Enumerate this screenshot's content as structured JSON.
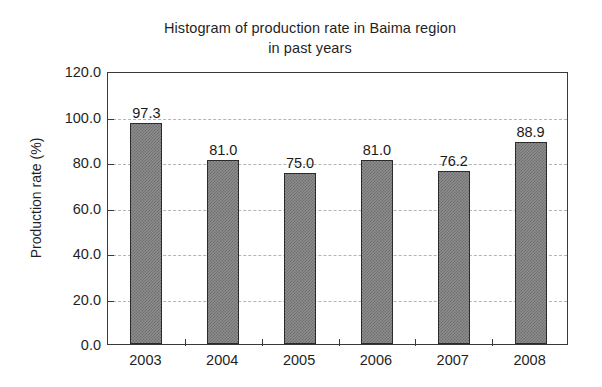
{
  "chart_data": {
    "type": "bar",
    "title": "Histogram of production rate in Baima region in past years",
    "title_lines": [
      "Histogram of production rate in Baima region",
      "in past years"
    ],
    "xlabel": "",
    "ylabel": "Production rate (%)",
    "categories": [
      "2003",
      "2004",
      "2005",
      "2006",
      "2007",
      "2008"
    ],
    "values": [
      97.3,
      81.0,
      75.0,
      81.0,
      76.2,
      88.9
    ],
    "value_labels": [
      "97.3",
      "81.0",
      "75.0",
      "81.0",
      "76.2",
      "88.9"
    ],
    "ylim": [
      0.0,
      120.0
    ],
    "ytick_values": [
      0.0,
      20.0,
      40.0,
      60.0,
      80.0,
      100.0,
      120.0
    ],
    "ytick_labels": [
      "0.0",
      "20.0",
      "40.0",
      "60.0",
      "80.0",
      "100.0",
      "120.0"
    ],
    "grid": "horizontal-dashed",
    "legend": "none",
    "colors": {
      "bar_fill": "#8d8d8d",
      "bar_edge": "#2b2b2b",
      "gridline": "#b4b4b4",
      "axis": "#3a3a3a",
      "text": "#1f1f1f",
      "background": "#ffffff"
    }
  }
}
